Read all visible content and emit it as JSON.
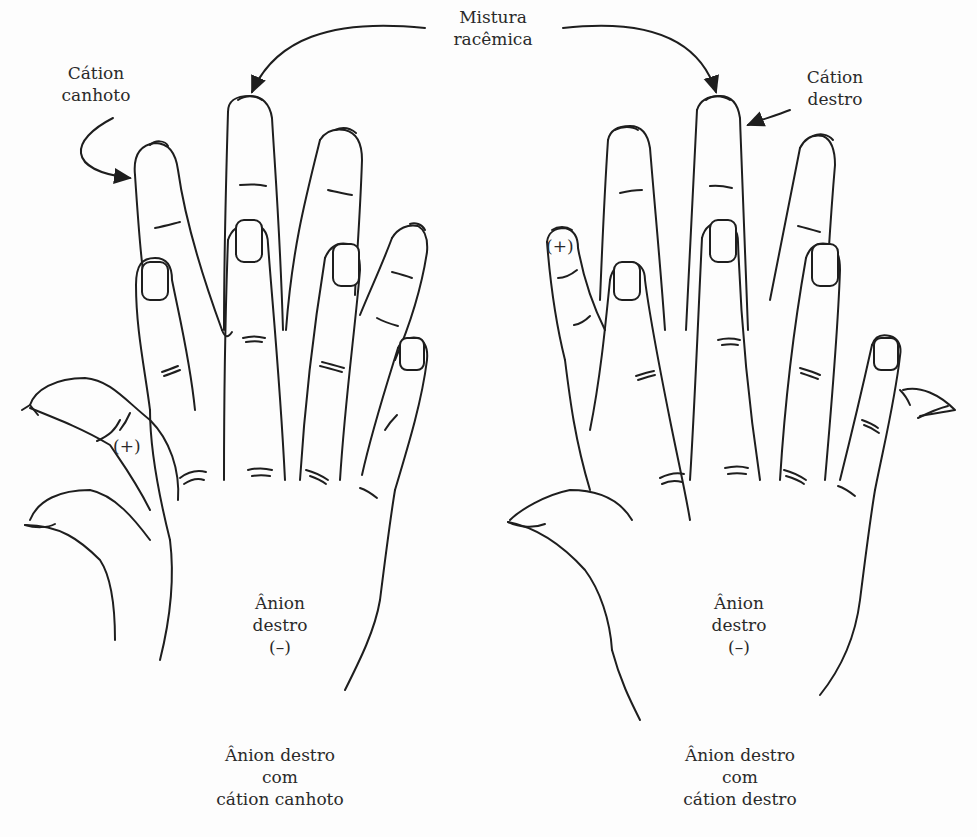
{
  "top_label": {
    "line1": "Mistura",
    "line2": "racêmica"
  },
  "left": {
    "cation_label": {
      "line1": "Cátion",
      "line2": "canhoto"
    },
    "cation_sign": "(+)",
    "anion_label": {
      "line1": "Ânion",
      "line2": "destro",
      "line3": "(–)"
    },
    "caption": {
      "line1": "Ânion destro",
      "line2": "com",
      "line3": "cátion canhoto"
    }
  },
  "right": {
    "cation_label": {
      "line1": "Cátion",
      "line2": "destro"
    },
    "cation_sign": "(+)",
    "anion_label": {
      "line1": "Ânion",
      "line2": "destro",
      "line3": "(–)"
    },
    "caption": {
      "line1": "Ânion destro",
      "line2": "com",
      "line3": "cátion destro"
    }
  },
  "colors": {
    "stroke": "#1e1e1e",
    "text": "#2a2a2a",
    "background": "#fdfdfd"
  }
}
